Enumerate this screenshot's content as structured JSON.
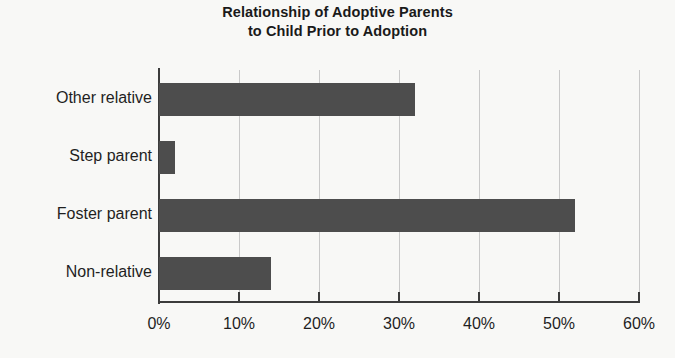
{
  "chart_data": {
    "type": "bar",
    "orientation": "horizontal",
    "title": "Relationship of Adoptive Parents to Child Prior to Adoption",
    "title_line1": "Relationship of Adoptive Parents",
    "title_line2": "to Child Prior to Adoption",
    "categories": [
      "Other relative",
      "Step parent",
      "Foster parent",
      "Non-relative"
    ],
    "values": [
      32,
      2,
      52,
      14
    ],
    "value_suffix": "%",
    "xlabel": "",
    "ylabel": "",
    "xlim": [
      0,
      60
    ],
    "xticks": [
      0,
      10,
      20,
      30,
      40,
      50,
      60
    ],
    "xtick_labels": [
      "0%",
      "10%",
      "20%",
      "30%",
      "40%",
      "50%",
      "60%"
    ],
    "grid": "vertical",
    "legend": "none",
    "bar_color": "#4d4d4d",
    "axis_color": "#3c3c3c",
    "gridline_color": "#c9c9c9",
    "background_color": "#f8f8f6"
  }
}
